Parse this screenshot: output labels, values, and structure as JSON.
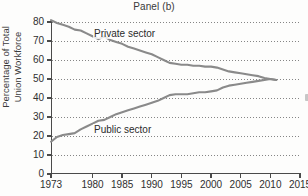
{
  "chart_data": {
    "type": "line",
    "title": "Panel (b)",
    "xlabel": "",
    "ylabel": "Percentage of Total Union Workforce",
    "ylabel_lines": [
      "Percentage of Total",
      "Union Workforce"
    ],
    "xlim": [
      1973,
      2015
    ],
    "ylim": [
      0,
      80
    ],
    "grid": "horizontal-dotted",
    "legend_position": "inline-annotations",
    "yticks": [
      0,
      10,
      20,
      30,
      40,
      50,
      60,
      70,
      80
    ],
    "ytick_labels": [
      "0",
      "10",
      "20",
      "30",
      "40",
      "50",
      "60",
      "70",
      "80"
    ],
    "xticks": [
      1973,
      1980,
      1985,
      1990,
      1995,
      2000,
      2005,
      2010,
      2015
    ],
    "xtick_labels": [
      "1973",
      "1980",
      "1985",
      "1990",
      "1995",
      "2000",
      "2005",
      "2010",
      "2015"
    ],
    "annotations": [
      {
        "text": "Private sector",
        "x": 1985,
        "y": 72
      },
      {
        "text": "Public sector",
        "x": 1986,
        "y": 26
      }
    ],
    "line_color": "#8a8a8a",
    "series": [
      {
        "name": "Private sector",
        "color": "#8a8a8a",
        "x": [
          1973,
          1974,
          1975,
          1976,
          1977,
          1978,
          1979,
          1980,
          1981,
          1982,
          1983,
          1984,
          1985,
          1986,
          1987,
          1988,
          1989,
          1990,
          1991,
          1992,
          1993,
          1994,
          1995,
          1996,
          1997,
          1998,
          1999,
          2000,
          2001,
          2002,
          2003,
          2004,
          2005,
          2006,
          2007,
          2008,
          2009,
          2010,
          2011
        ],
        "values": [
          81.0,
          79.5,
          78.5,
          77.5,
          76.0,
          75.5,
          74.0,
          72.5,
          71.0,
          72.5,
          70.5,
          69.5,
          68.5,
          67.0,
          66.0,
          65.0,
          64.0,
          63.0,
          61.5,
          60.0,
          58.5,
          58.0,
          57.5,
          57.5,
          57.0,
          57.0,
          56.5,
          56.5,
          56.0,
          55.0,
          54.0,
          53.5,
          53.0,
          52.5,
          52.0,
          51.5,
          50.5,
          50.0,
          49.5
        ]
      },
      {
        "name": "Public sector",
        "color": "#8a8a8a",
        "x": [
          1973,
          1974,
          1975,
          1976,
          1977,
          1978,
          1979,
          1980,
          1981,
          1982,
          1983,
          1984,
          1985,
          1986,
          1987,
          1988,
          1989,
          1990,
          1991,
          1992,
          1993,
          1994,
          1995,
          1996,
          1997,
          1998,
          1999,
          2000,
          2001,
          2002,
          2003,
          2004,
          2005,
          2006,
          2007,
          2008,
          2009,
          2010,
          2011
        ],
        "values": [
          17.0,
          19.5,
          20.5,
          21.0,
          21.5,
          23.5,
          25.0,
          26.5,
          28.0,
          28.5,
          30.0,
          31.5,
          32.5,
          33.5,
          34.5,
          35.5,
          36.5,
          37.5,
          38.5,
          40.0,
          41.5,
          42.0,
          42.0,
          42.0,
          42.5,
          43.0,
          43.0,
          43.5,
          44.0,
          45.5,
          46.5,
          47.0,
          47.5,
          48.0,
          48.5,
          49.0,
          49.5,
          50.0,
          49.5
        ]
      }
    ]
  }
}
